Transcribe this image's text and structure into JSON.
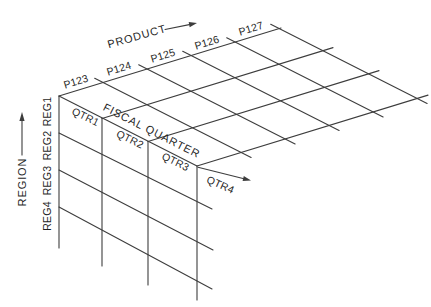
{
  "diagram": {
    "type": "data-cube-wireframe"
  },
  "axes": {
    "product": {
      "label": "PRODUCT",
      "values": [
        "P123",
        "P124",
        "P125",
        "P126",
        "P127"
      ]
    },
    "fiscal_quarter": {
      "label": "FISCAL QUARTER",
      "values": [
        "QTR1",
        "QTR2",
        "QTR3",
        "QTR4"
      ]
    },
    "region": {
      "label": "REGION",
      "values": [
        "REG1",
        "REG2",
        "REG3",
        "REG4"
      ]
    }
  },
  "colors": {
    "line": "#3d3d3d",
    "text": "#1f1f1f",
    "background": "#ffffff"
  }
}
